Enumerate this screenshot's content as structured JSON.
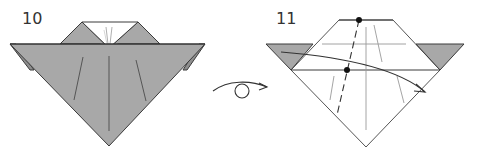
{
  "diagram": {
    "type": "origami-instructions",
    "colors": {
      "paper_colored": "#a8a8a8",
      "paper_white": "#ffffff",
      "edge": "#3a3a3a",
      "crease": "#6a6a6a",
      "light_crease": "#9a9a9a"
    },
    "steps": [
      {
        "number": "10",
        "description": "Colored side up, model with white triangle notch at top"
      },
      {
        "number": "11",
        "description": "Model turned over; valley fold along dashed line between marked dots, fold left over to right"
      }
    ],
    "transition_symbol": {
      "name": "turn-over",
      "description": "Turn the model over"
    },
    "step11_markers": {
      "reference_dots": 2,
      "fold_line": "dashed",
      "arrow": "left-to-right curved"
    }
  }
}
